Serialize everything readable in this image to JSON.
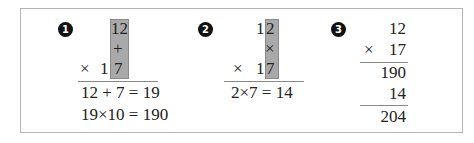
{
  "panels": [
    {
      "badge": "1",
      "column": {
        "top": "12",
        "operator": "+",
        "bottom": "7"
      },
      "multiplier_row": {
        "sign": "×",
        "digit": "1"
      },
      "steps": [
        "12 + 7 = 19",
        "19×10 = 190"
      ]
    },
    {
      "badge": "2",
      "top_tens": "1",
      "column": {
        "top": "2",
        "operator": "×",
        "bottom": "7"
      },
      "multiplier_row": {
        "sign": "×",
        "digit": "1"
      },
      "steps": [
        "2×7 = 14"
      ]
    },
    {
      "badge": "3",
      "multiplicand": "12",
      "multiplier_sign": "×",
      "multiplier": "17",
      "partial": "190",
      "add": "14",
      "result": "204"
    }
  ],
  "colors": {
    "highlight": "#a9a9a9",
    "border": "#b5b5b5",
    "badge": "#111111"
  }
}
